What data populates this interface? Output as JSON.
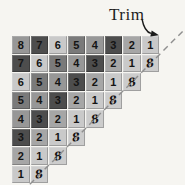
{
  "labels": {
    "trim": "Trim"
  },
  "palette": {
    "dark": "#4d4d4d",
    "med_dark": "#7a7a7a",
    "med": "#979797",
    "med_light": "#a6a6a6",
    "light": "#c9c9c9",
    "trim_cell": "#cccccc",
    "number_text": "#141414",
    "background": "#f6f5f1",
    "dash_line": "#8f8f8f",
    "arrow": "#1a1a1a"
  },
  "grid": {
    "description": "Staircase of rows counting down to 1, with slanted 8s appended along the diagonal that the dashed Trim line cuts off",
    "rows": [
      [
        {
          "v": "8",
          "s": "med"
        },
        {
          "v": "7",
          "s": "dark"
        },
        {
          "v": "6",
          "s": "light"
        },
        {
          "v": "5",
          "s": "med_dark"
        },
        {
          "v": "4",
          "s": "med"
        },
        {
          "v": "3",
          "s": "dark"
        },
        {
          "v": "2",
          "s": "med_light"
        },
        {
          "v": "1",
          "s": "light"
        }
      ],
      [
        {
          "v": "7",
          "s": "dark"
        },
        {
          "v": "6",
          "s": "light"
        },
        {
          "v": "5",
          "s": "med_dark"
        },
        {
          "v": "4",
          "s": "med"
        },
        {
          "v": "3",
          "s": "dark"
        },
        {
          "v": "2",
          "s": "med_light"
        },
        {
          "v": "1",
          "s": "light"
        },
        {
          "v": "8",
          "s": "trim_cell",
          "trim": true
        }
      ],
      [
        {
          "v": "6",
          "s": "light"
        },
        {
          "v": "5",
          "s": "med_dark"
        },
        {
          "v": "4",
          "s": "med"
        },
        {
          "v": "3",
          "s": "dark"
        },
        {
          "v": "2",
          "s": "med_light"
        },
        {
          "v": "1",
          "s": "light"
        },
        {
          "v": "8",
          "s": "trim_cell",
          "trim": true
        }
      ],
      [
        {
          "v": "5",
          "s": "med_dark"
        },
        {
          "v": "4",
          "s": "med"
        },
        {
          "v": "3",
          "s": "dark"
        },
        {
          "v": "2",
          "s": "med_light"
        },
        {
          "v": "1",
          "s": "light"
        },
        {
          "v": "8",
          "s": "trim_cell",
          "trim": true
        }
      ],
      [
        {
          "v": "4",
          "s": "med"
        },
        {
          "v": "3",
          "s": "dark"
        },
        {
          "v": "2",
          "s": "med_light"
        },
        {
          "v": "1",
          "s": "light"
        },
        {
          "v": "8",
          "s": "trim_cell",
          "trim": true
        }
      ],
      [
        {
          "v": "3",
          "s": "dark"
        },
        {
          "v": "2",
          "s": "med_light"
        },
        {
          "v": "1",
          "s": "light"
        },
        {
          "v": "8",
          "s": "trim_cell",
          "trim": true
        }
      ],
      [
        {
          "v": "2",
          "s": "med_light"
        },
        {
          "v": "1",
          "s": "light"
        },
        {
          "v": "8",
          "s": "trim_cell",
          "trim": true
        }
      ],
      [
        {
          "v": "1",
          "s": "light"
        },
        {
          "v": "8",
          "s": "trim_cell",
          "trim": true
        }
      ]
    ]
  }
}
